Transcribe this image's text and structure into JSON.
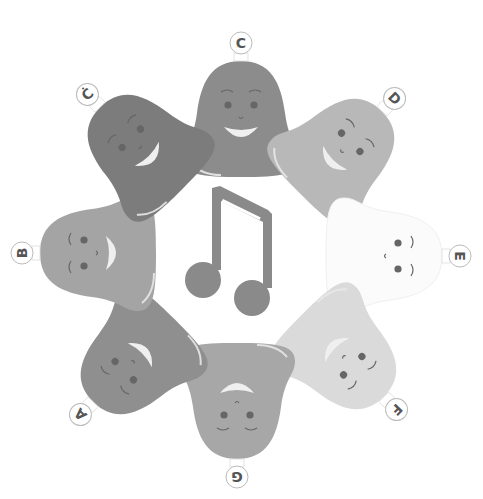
{
  "scene": {
    "description": "Ring of eight singing bell characters around a central eighth-note pair",
    "background": "#ffffff",
    "center_icon": "beamed-eighth-notes-icon",
    "note_color": "#8a8a8a"
  },
  "bells": [
    {
      "id": "c",
      "label": "C",
      "fill": "#8c8c8c",
      "cx": 241,
      "cy": 123,
      "rot": 0
    },
    {
      "id": "d",
      "label": "D",
      "fill": "#b8b8b8",
      "cx": 338,
      "cy": 155,
      "rot": 45
    },
    {
      "id": "e",
      "label": "E",
      "fill": "#fbfbfb",
      "cx": 380,
      "cy": 256,
      "rot": 90
    },
    {
      "id": "f",
      "label": "F",
      "fill": "#dadada",
      "cx": 340,
      "cy": 353,
      "rot": 135
    },
    {
      "id": "g",
      "label": "G",
      "fill": "#a7a7a7",
      "cx": 237,
      "cy": 397,
      "rot": 180
    },
    {
      "id": "a",
      "label": "A",
      "fill": "#8f8f8f",
      "cx": 137,
      "cy": 358,
      "rot": 225
    },
    {
      "id": "b",
      "label": "B",
      "fill": "#a4a4a4",
      "cx": 102,
      "cy": 253,
      "rot": 270
    },
    {
      "id": "c2",
      "label": "Ċ",
      "fill": "#7c7c7c",
      "cx": 144,
      "cy": 151,
      "rot": 315
    }
  ]
}
